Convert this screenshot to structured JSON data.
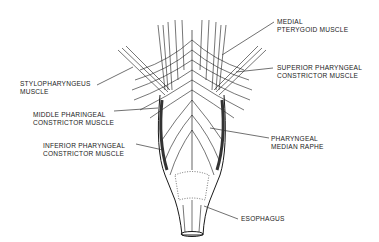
{
  "diagram": {
    "labels": {
      "medial_pterygoid": [
        "MEDIAL",
        "PTERYGOID MUSCLE"
      ],
      "superior_constrictor": [
        "SUPERIOR PHARYNGEAL",
        "CONSTRICTOR MUSCLE"
      ],
      "stylopharyngeus": [
        "STYLOPHARYNGEUS",
        "MUSCLE"
      ],
      "middle_constrictor": [
        "MIDDLE PHARINGEAL",
        "CONSTRICTOR MUSCLE"
      ],
      "pharyngeal_raphe": [
        "PHARYNGEAL",
        "MEDIAN RAPHE"
      ],
      "inferior_constrictor": [
        "INFERIOR PHARYNGEAL",
        "CONSTRICTOR MUSCLE"
      ],
      "esophagus": [
        "ESOPHAGUS"
      ]
    },
    "colors": {
      "ink": "#1a1a1a",
      "background": "#ffffff"
    }
  }
}
